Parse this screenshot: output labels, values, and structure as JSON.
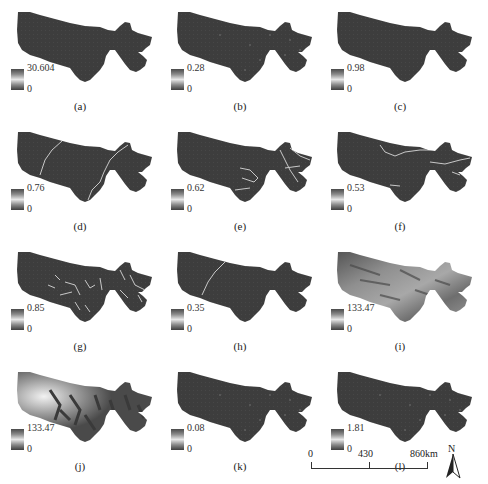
{
  "figure": {
    "panels": [
      {
        "id": "a",
        "caption": "(a)",
        "legend_max": "30.604",
        "legend_min": "0",
        "style": "dark"
      },
      {
        "id": "b",
        "caption": "(b)",
        "legend_max": "0.28",
        "legend_min": "0",
        "style": "dark-dots"
      },
      {
        "id": "c",
        "caption": "(c)",
        "legend_max": "0.98",
        "legend_min": "0",
        "style": "dark"
      },
      {
        "id": "d",
        "caption": "(d)",
        "legend_max": "0.76",
        "legend_min": "0",
        "style": "lines-d"
      },
      {
        "id": "e",
        "caption": "(e)",
        "legend_max": "0.62",
        "legend_min": "0",
        "style": "lines-e"
      },
      {
        "id": "f",
        "caption": "(f)",
        "legend_max": "0.53",
        "legend_min": "0",
        "style": "lines-f"
      },
      {
        "id": "g",
        "caption": "(g)",
        "legend_max": "0.85",
        "legend_min": "0",
        "style": "lines-g"
      },
      {
        "id": "h",
        "caption": "(h)",
        "legend_max": "0.35",
        "legend_min": "0",
        "style": "lines-h"
      },
      {
        "id": "i",
        "caption": "(i)",
        "legend_max": "133.47",
        "legend_min": "0",
        "style": "texture"
      },
      {
        "id": "j",
        "caption": "(j)",
        "legend_max": "133.47",
        "legend_min": "0",
        "style": "distance"
      },
      {
        "id": "k",
        "caption": "(k)",
        "legend_max": "0.08",
        "legend_min": "0",
        "style": "dark-dots"
      },
      {
        "id": "l",
        "caption": "(l)",
        "legend_max": "1.81",
        "legend_min": "0",
        "style": "dark-dots"
      }
    ],
    "scale_bar": {
      "labels": [
        "0",
        "430",
        "860km"
      ]
    },
    "north_arrow": {
      "label": "N"
    },
    "colors": {
      "region_fill": "#3d3d3d",
      "feature_line": "#c8c8c8",
      "background": "#ffffff"
    }
  }
}
